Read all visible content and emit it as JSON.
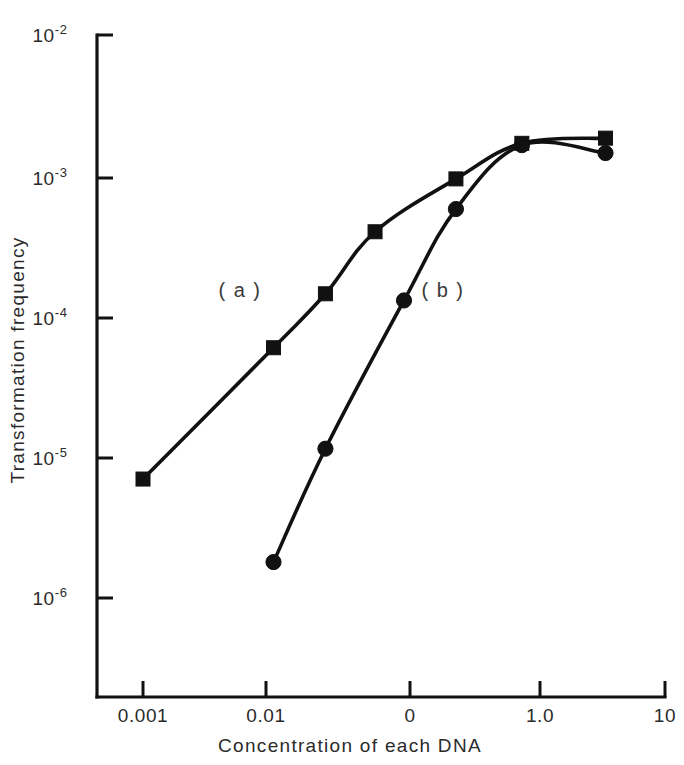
{
  "chart_data": {
    "type": "line",
    "title": "",
    "xlabel": "Concentration of each DNA",
    "ylabel": "Transformation frequency",
    "xscale": "log",
    "yscale": "log",
    "xlim": [
      0.0004,
      10
    ],
    "ylim": [
      1e-06,
      0.01
    ],
    "grid": false,
    "legend_position": "inline-annotation",
    "x_tick_labels": [
      "0.001",
      "0.01",
      "0",
      "1.0",
      "10"
    ],
    "x_tick_values": [
      0.001,
      0.01,
      0.1,
      1.0,
      10
    ],
    "y_tick_labels": [
      "10-2",
      "10-3",
      "10-4",
      "10-5",
      "10-6"
    ],
    "y_tick_bases": [
      "10",
      "10",
      "10",
      "10",
      "10"
    ],
    "y_tick_exponents": [
      "-2",
      "-3",
      "-4",
      "-5",
      "-6"
    ],
    "y_tick_values": [
      0.01,
      0.001,
      0.0001,
      1e-05,
      1e-06
    ],
    "series": [
      {
        "name": "(a)",
        "marker": "square",
        "color": "#111111",
        "annotation": "( a )",
        "points": [
          {
            "x": 0.001,
            "y": 7e-06
          },
          {
            "x": 0.01,
            "y": 6e-05
          },
          {
            "x": 0.025,
            "y": 0.000145
          },
          {
            "x": 0.06,
            "y": 0.0004
          },
          {
            "x": 0.25,
            "y": 0.00095
          },
          {
            "x": 0.8,
            "y": 0.0017
          },
          {
            "x": 3.5,
            "y": 0.00185
          }
        ]
      },
      {
        "name": "(b)",
        "marker": "circle",
        "color": "#111111",
        "annotation": "( b )",
        "points": [
          {
            "x": 0.01,
            "y": 1.8e-06
          },
          {
            "x": 0.025,
            "y": 1.15e-05
          },
          {
            "x": 0.1,
            "y": 0.00013
          },
          {
            "x": 0.25,
            "y": 0.00058
          },
          {
            "x": 0.8,
            "y": 0.00165
          },
          {
            "x": 3.5,
            "y": 0.00145
          }
        ]
      }
    ],
    "annotations": [
      {
        "text": "( a )",
        "x_px": 240,
        "y_px": 297
      },
      {
        "text": "( b )",
        "x_px": 443,
        "y_px": 297
      }
    ]
  },
  "axes": {
    "y_title": "Transformation frequency",
    "x_title": "Concentration of each DNA"
  },
  "ticks": {
    "y": [
      {
        "base": "10",
        "exp": "-2",
        "py": 35
      },
      {
        "base": "10",
        "exp": "-3",
        "py": 178
      },
      {
        "base": "10",
        "exp": "-4",
        "py": 318
      },
      {
        "base": "10",
        "exp": "-5",
        "py": 458
      },
      {
        "base": "10",
        "exp": "-6",
        "py": 598
      }
    ],
    "x": [
      {
        "label": "0.001",
        "px": 143
      },
      {
        "label": "0.01",
        "px": 266
      },
      {
        "label": "0",
        "px": 410
      },
      {
        "label": "1.0",
        "px": 540
      },
      {
        "label": "10",
        "px": 665
      }
    ]
  }
}
